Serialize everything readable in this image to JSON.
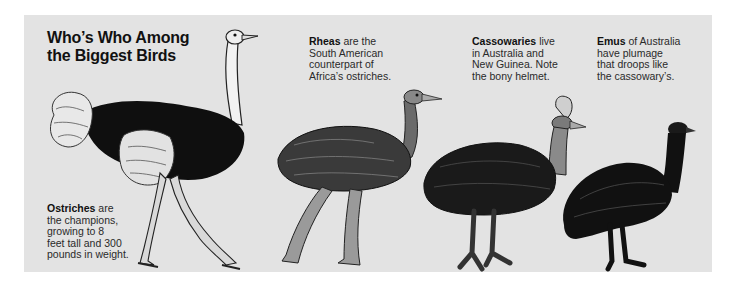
{
  "title": {
    "line1": "Who’s Who Among",
    "line2": "the Biggest Birds"
  },
  "captions": {
    "ostrich": {
      "name": "Ostriches",
      "lines": [
        " are",
        "the champions,",
        "growing to 8",
        "feet tall and 300",
        "pounds in weight."
      ]
    },
    "rhea": {
      "name": "Rheas",
      "lines": [
        " are the",
        "South American",
        "counterpart of",
        "Africa’s ostriches."
      ]
    },
    "cassowary": {
      "name": "Cassowaries",
      "lines": [
        " live",
        "in Australia and",
        "New Guinea. Note",
        "the bony helmet."
      ]
    },
    "emu": {
      "name": "Emus",
      "lines": [
        " of Australia",
        "have plumage",
        "that droops like",
        "the cassowary’s."
      ]
    }
  },
  "illustrations": [
    "ostrich-illustration",
    "rhea-illustration",
    "cassowary-illustration",
    "emu-illustration"
  ],
  "colors": {
    "panel_bg": "#e3e3e3",
    "ink": "#111111"
  }
}
